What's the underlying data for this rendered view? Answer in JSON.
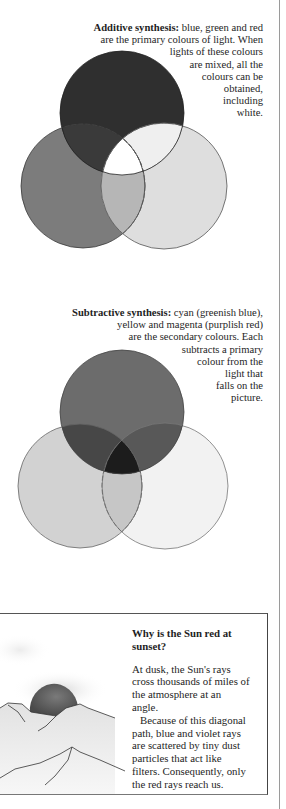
{
  "additive": {
    "heading": "Additive synthesis:",
    "lines": [
      " blue, green and red",
      "are the primary colours of light. When",
      "lights of these colours",
      "are mixed, all the",
      "colours can be",
      "obtained,",
      "including",
      "white."
    ],
    "colors": {
      "top": "#2f2f2f",
      "left": "#7c7c7c",
      "right": "#dedede",
      "top_left": "#3a3a3a",
      "top_right": "#efefef",
      "left_right": "#b6b6b6",
      "center": "#ffffff"
    }
  },
  "subtractive": {
    "heading": "Subtractive synthesis:",
    "lines": [
      " cyan (greenish blue),",
      "yellow and magenta (purplish red)",
      "are the secondary colours. Each",
      "subtracts a primary",
      "colour from the",
      "light that",
      "falls on the",
      "picture."
    ],
    "colors": {
      "top": "#6c6c6c",
      "left": "#d2d2d2",
      "right": "#f2f2f2",
      "top_left": "#474747",
      "top_right": "#585858",
      "left_right": "#c6c6c6",
      "center": "#1c1c1c"
    }
  },
  "sunset_box": {
    "title_lines": [
      "Why is the Sun red at",
      "sunset?"
    ],
    "body_lines": [
      "At dusk, the Sun's rays",
      "cross thousands of miles of",
      "the atmosphere at an",
      "angle.",
      "Because of this diagonal",
      "path, blue and violet rays",
      "are scattered by tiny dust",
      "particles that act like",
      "filters. Consequently, only",
      "the red rays reach us."
    ]
  }
}
